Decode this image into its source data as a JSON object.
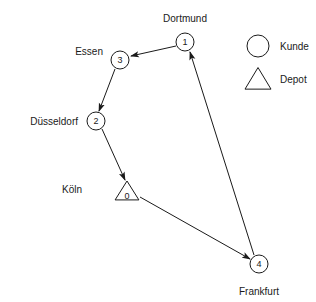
{
  "diagram": {
    "colors": {
      "stroke": "#1a1a1a",
      "fill": "#ffffff",
      "background": "#ffffff"
    },
    "nodes": [
      {
        "id": "0",
        "shape": "triangle",
        "role": "depot",
        "city": "Köln",
        "x": 127,
        "y": 192,
        "size": 11,
        "label_x": 82,
        "label_y": 189,
        "label_anchor": "end"
      },
      {
        "id": "1",
        "shape": "circle",
        "role": "kunde",
        "city": "Dortmund",
        "x": 185,
        "y": 42,
        "size": 9,
        "label_x": 185,
        "label_y": 18,
        "label_anchor": "middle"
      },
      {
        "id": "2",
        "shape": "circle",
        "role": "kunde",
        "city": "Düsseldorf",
        "x": 96,
        "y": 121,
        "size": 9,
        "label_x": 78,
        "label_y": 121,
        "label_anchor": "end"
      },
      {
        "id": "3",
        "shape": "circle",
        "role": "kunde",
        "city": "Essen",
        "x": 120,
        "y": 60,
        "size": 9,
        "label_x": 103,
        "label_y": 51,
        "label_anchor": "end"
      },
      {
        "id": "4",
        "shape": "circle",
        "role": "kunde",
        "city": "Frankfurt",
        "x": 259,
        "y": 264,
        "size": 9,
        "label_x": 259,
        "label_y": 291,
        "label_anchor": "middle"
      }
    ],
    "edges": [
      {
        "from": "1",
        "to": "3",
        "x1": 176,
        "y1": 46,
        "x2": 131,
        "y2": 56
      },
      {
        "from": "3",
        "to": "2",
        "x1": 115,
        "y1": 69,
        "x2": 99,
        "y2": 111
      },
      {
        "from": "2",
        "to": "0",
        "x1": 102,
        "y1": 129,
        "x2": 125,
        "y2": 180
      },
      {
        "from": "0",
        "to": "4",
        "x1": 140,
        "y1": 197,
        "x2": 250,
        "y2": 259
      },
      {
        "from": "4",
        "to": "1",
        "x1": 254,
        "y1": 255,
        "x2": 190,
        "y2": 52
      }
    ],
    "legend": {
      "items": [
        {
          "symbol": "circle",
          "label": "Kunde",
          "x": 258,
          "y": 46,
          "size": 11,
          "label_x": 280,
          "label_y": 46
        },
        {
          "symbol": "triangle",
          "label": "Depot",
          "x": 258,
          "y": 79,
          "size": 13,
          "label_x": 280,
          "label_y": 79
        }
      ]
    }
  }
}
